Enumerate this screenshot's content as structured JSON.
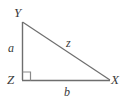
{
  "figure": {
    "name": "right-triangle-xyz",
    "background_color": "#ffffff",
    "stroke_color": "#6e6e6e",
    "label_color": "#3a3a3a",
    "vertices": [
      {
        "id": "Y",
        "label": "Y",
        "x": 22,
        "y": 22,
        "role": "apex-top-left"
      },
      {
        "id": "Z",
        "label": "Z",
        "x": 22,
        "y": 80,
        "role": "right-angle-bottom-left"
      },
      {
        "id": "X",
        "label": "X",
        "x": 110,
        "y": 80,
        "role": "bottom-right"
      }
    ],
    "sides": [
      {
        "id": "a",
        "label": "a",
        "from": "Y",
        "to": "Z",
        "kind": "vertical-leg"
      },
      {
        "id": "b",
        "label": "b",
        "from": "Z",
        "to": "X",
        "kind": "horizontal-leg"
      },
      {
        "id": "z",
        "label": "z",
        "from": "Y",
        "to": "X",
        "kind": "hypotenuse"
      }
    ],
    "right_angle_marker": {
      "at_vertex": "Z",
      "size": 8,
      "visible": true
    }
  }
}
